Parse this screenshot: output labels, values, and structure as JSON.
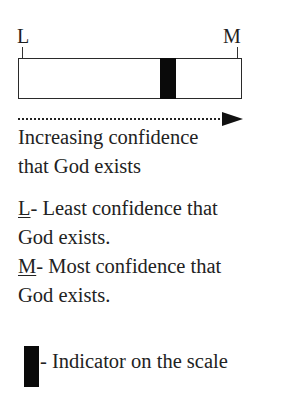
{
  "scale": {
    "left_label": "L",
    "right_label": "M",
    "indicator_position_pct": 65,
    "arrow_caption_line1": "Increasing confidence",
    "arrow_caption_line2": "that God exists"
  },
  "legend": {
    "l_key": "L",
    "l_desc_line1": "- Least confidence that",
    "l_desc_line2": "God exists.",
    "m_key": "M",
    "m_desc_line1": "- Most confidence that",
    "m_desc_line2": "God exists.",
    "indicator_desc": "- Indicator on the scale"
  },
  "colors": {
    "marker": "#0a0a0a",
    "text": "#222222",
    "background": "#ffffff"
  }
}
